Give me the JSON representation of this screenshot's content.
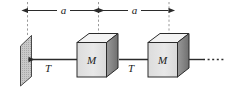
{
  "figure": {
    "type": "physics-free-body-diagram",
    "width": 229,
    "height": 96,
    "background_color": "#ffffff"
  },
  "dimensions": {
    "label_left": "a",
    "label_right": "a",
    "extension_lines": 3,
    "arrow_color": "#2b2b2b"
  },
  "wall": {
    "name": "fixed-wall",
    "fill_color": "#c9c9c9",
    "edge_color": "#3a3a3a"
  },
  "blocks": [
    {
      "label": "M",
      "face_color": "#e3e3e3",
      "top_color": "#f2f2f2",
      "side_color": "#8d8d8d",
      "edge_color": "#2b2b2b"
    },
    {
      "label": "M",
      "face_color": "#e3e3e3",
      "top_color": "#f2f2f2",
      "side_color": "#8d8d8d",
      "edge_color": "#2b2b2b"
    }
  ],
  "forces": [
    {
      "label": "T",
      "direction": "left",
      "name": "tension-left"
    },
    {
      "label": "T",
      "direction": "right",
      "name": "tension-right"
    }
  ],
  "continuation": {
    "style": "dotted",
    "name": "chain-continues"
  }
}
